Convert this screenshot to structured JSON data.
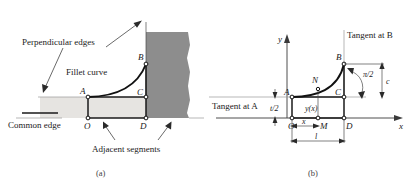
{
  "figure": {
    "panel_a": {
      "caption": "(a)",
      "annotations": {
        "perpendicular_edges": "Perpendicular edges",
        "fillet_curve": "Fillet curve",
        "common_edge": "Common edge",
        "adjacent_segments": "Adjacent segments"
      },
      "points": {
        "A": "A",
        "B": "B",
        "C": "C",
        "D": "D",
        "O": "O"
      },
      "colors": {
        "dark_block": "#8d8d8d",
        "light_block": "#e6e4e1",
        "curve": "#111111"
      }
    },
    "panel_b": {
      "caption": "(b)",
      "axes": {
        "x": "x",
        "y": "y"
      },
      "annotations": {
        "tangent_at_a": "Tangent at A",
        "tangent_at_b": "Tangent at B",
        "angle": "π/2",
        "function": "y(x)"
      },
      "points": {
        "A": "A",
        "B": "B",
        "C": "C",
        "D": "D",
        "M": "M",
        "N": "N",
        "O": "O"
      },
      "dimensions": {
        "half_thickness": "t/2",
        "x": "x",
        "length": "l",
        "height": "c"
      },
      "colors": {
        "curve": "#111111",
        "axis": "#3a3a3a"
      }
    }
  }
}
